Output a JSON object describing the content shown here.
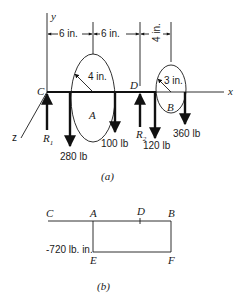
{
  "figure_a": {
    "caption": "(a)",
    "axes": {
      "x": "x",
      "y": "y",
      "z": "z"
    },
    "points": {
      "C": "C",
      "D": "D",
      "A": "A",
      "B": "B"
    },
    "dimensions": {
      "CA": "6 in.",
      "AD": "6 in.",
      "DB": "4 in.",
      "radius_A": "4 in.",
      "radius_B": "3 in."
    },
    "forces": {
      "R1": {
        "label": "R",
        "sub": "1",
        "direction": "up"
      },
      "F_A_left": {
        "label": "280 lb",
        "direction": "down"
      },
      "F_A_right": {
        "label": "100 lb",
        "direction": "down"
      },
      "R2": {
        "label": "R",
        "sub": "2",
        "direction": "up"
      },
      "F_B_left": {
        "label": "120 lb",
        "direction": "down"
      },
      "F_B_right": {
        "label": "360 lb",
        "direction": "down"
      }
    }
  },
  "figure_b": {
    "caption": "(b)",
    "points": {
      "C": "C",
      "A": "A",
      "D": "D",
      "B": "B",
      "E": "E",
      "F": "F"
    },
    "value_label": "-720 lb. in."
  }
}
